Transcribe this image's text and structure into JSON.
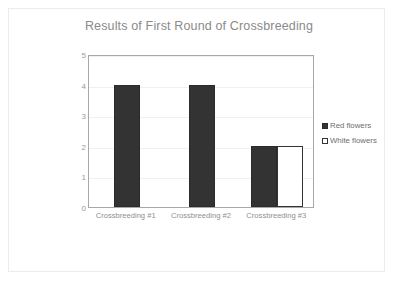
{
  "chart_data": {
    "type": "bar",
    "title": "Results of First Round of Crossbreeding",
    "xlabel": "",
    "ylabel": "",
    "categories": [
      "Crossbreeding #1",
      "Crossbreeding #2",
      "Crossbreeding #3"
    ],
    "series": [
      {
        "name": "Red flowers",
        "values": [
          4,
          4,
          2
        ],
        "color": "#333333",
        "style": "filled"
      },
      {
        "name": "White flowers",
        "values": [
          0,
          0,
          2
        ],
        "color": "#ffffff",
        "style": "outlined"
      }
    ],
    "ylim": [
      0,
      5
    ],
    "ytick_step": 1,
    "yticks": [
      "0",
      "1",
      "2",
      "3",
      "4",
      "5"
    ],
    "grid": true,
    "legend_position": "right",
    "title_color": "#8a8a8a",
    "axis_label_color": "#9a9a9a",
    "plot_border_color": "#a8a8a8",
    "gridline_color": "#f0f0f0",
    "frame_color": "#ececec"
  },
  "legend": {
    "items": [
      {
        "label": "Red flowers"
      },
      {
        "label": "White flowers"
      }
    ]
  }
}
